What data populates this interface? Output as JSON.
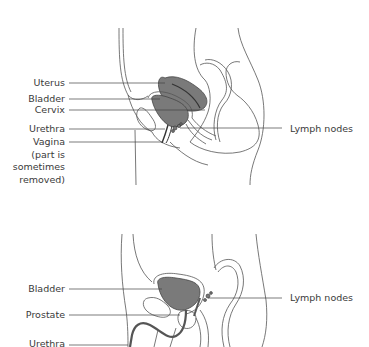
{
  "colors": {
    "organ_fill": "#7a7a7a",
    "line": "#555555",
    "label_text": "#3a3a3a",
    "background": "#ffffff"
  },
  "diagrams": [
    {
      "name": "female-pelvis",
      "labels": {
        "uterus": "Uterus",
        "bladder": "Bladder",
        "cervix": "Cervix",
        "urethra": "Urethra",
        "vagina_line1": "Vagina",
        "vagina_line2": "(part is",
        "vagina_line3": "sometimes",
        "vagina_line4": "removed)",
        "lymph_nodes": "Lymph nodes"
      }
    },
    {
      "name": "male-pelvis",
      "labels": {
        "bladder": "Bladder",
        "prostate": "Prostate",
        "urethra": "Urethra",
        "lymph_nodes": "Lymph nodes"
      }
    }
  ]
}
